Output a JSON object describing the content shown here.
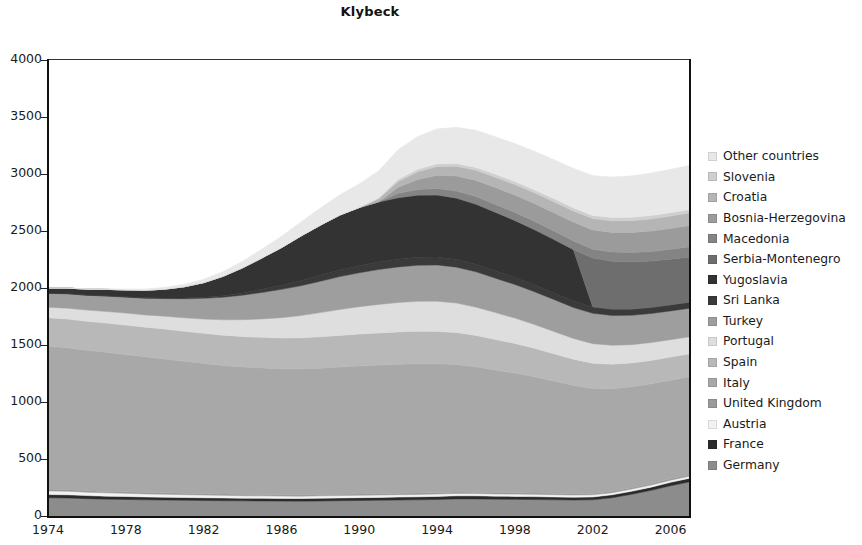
{
  "chart_data": {
    "type": "area",
    "title": "Klybeck",
    "xlabel": "",
    "ylabel": "",
    "stacked": true,
    "grid": false,
    "legend_position": "right",
    "xlim": [
      1974,
      2007
    ],
    "ylim": [
      0,
      4000
    ],
    "ytick_values": [
      0,
      500,
      1000,
      1500,
      2000,
      2500,
      3000,
      3500,
      4000
    ],
    "ytick_labels": [
      "0",
      "500",
      "1000",
      "1500",
      "2000",
      "2500",
      "3000",
      "3500",
      "4000"
    ],
    "xtick_values": [
      1974,
      1978,
      1982,
      1986,
      1990,
      1994,
      1998,
      2002,
      2006
    ],
    "xtick_labels": [
      "1974",
      "1978",
      "1982",
      "1986",
      "1990",
      "1994",
      "1998",
      "2002",
      "2006"
    ],
    "x": [
      1974,
      1975,
      1976,
      1977,
      1978,
      1979,
      1980,
      1981,
      1982,
      1983,
      1984,
      1985,
      1986,
      1987,
      1988,
      1989,
      1990,
      1991,
      1992,
      1993,
      1994,
      1995,
      1996,
      1997,
      1998,
      1999,
      2000,
      2001,
      2002,
      2003,
      2004,
      2005,
      2006,
      2007
    ],
    "stack_order_bottom_to_top": [
      "Germany",
      "France",
      "Austria",
      "United Kingdom",
      "Italy",
      "Spain",
      "Portugal",
      "Turkey",
      "Sri Lanka",
      "Yugoslavia",
      "Serbia-Montenegro",
      "Macedonia",
      "Bosnia-Herzegovina",
      "Croatia",
      "Slovenia",
      "Other countries"
    ],
    "series": [
      {
        "name": "Germany",
        "color": "#8c8c8c",
        "values": [
          160,
          158,
          152,
          148,
          145,
          142,
          140,
          138,
          136,
          134,
          133,
          132,
          131,
          130,
          132,
          134,
          136,
          138,
          140,
          142,
          145,
          150,
          150,
          148,
          146,
          144,
          142,
          140,
          142,
          160,
          190,
          225,
          265,
          300
        ]
      },
      {
        "name": "France",
        "color": "#2b2b2b",
        "values": [
          28,
          28,
          27,
          26,
          26,
          25,
          25,
          24,
          24,
          24,
          23,
          23,
          23,
          23,
          24,
          24,
          25,
          25,
          26,
          26,
          27,
          27,
          27,
          26,
          26,
          26,
          25,
          25,
          25,
          26,
          27,
          28,
          30,
          32
        ]
      },
      {
        "name": "Austria",
        "color": "#f2f2f2",
        "values": [
          32,
          31,
          30,
          29,
          28,
          27,
          26,
          25,
          24,
          23,
          22,
          22,
          21,
          21,
          21,
          21,
          21,
          21,
          21,
          21,
          21,
          21,
          20,
          20,
          20,
          20,
          20,
          19,
          19,
          19,
          19,
          19,
          19,
          19
        ]
      },
      {
        "name": "United Kingdom",
        "color": "#9a9a9a",
        "values": [
          14,
          14,
          13,
          13,
          13,
          12,
          12,
          12,
          12,
          12,
          12,
          12,
          12,
          12,
          12,
          12,
          12,
          12,
          12,
          12,
          12,
          12,
          12,
          12,
          12,
          12,
          12,
          12,
          12,
          12,
          12,
          12,
          12,
          12
        ]
      },
      {
        "name": "Italy",
        "color": "#a8a8a8",
        "values": [
          1255,
          1245,
          1232,
          1220,
          1205,
          1190,
          1175,
          1158,
          1142,
          1128,
          1118,
          1110,
          1105,
          1105,
          1108,
          1115,
          1122,
          1128,
          1132,
          1135,
          1130,
          1120,
          1100,
          1075,
          1050,
          1020,
          985,
          950,
          920,
          900,
          885,
          875,
          865,
          860
        ]
      },
      {
        "name": "Spain",
        "color": "#b8b8b8",
        "values": [
          250,
          252,
          254,
          256,
          258,
          260,
          262,
          263,
          264,
          265,
          266,
          268,
          270,
          272,
          275,
          278,
          280,
          282,
          284,
          285,
          284,
          280,
          275,
          268,
          260,
          250,
          240,
          230,
          222,
          215,
          210,
          206,
          203,
          200
        ]
      },
      {
        "name": "Portugal",
        "color": "#dedede",
        "values": [
          92,
          95,
          98,
          102,
          105,
          108,
          112,
          118,
          125,
          135,
          148,
          162,
          178,
          195,
          212,
          228,
          240,
          250,
          258,
          262,
          265,
          258,
          248,
          235,
          222,
          208,
          195,
          182,
          172,
          165,
          160,
          156,
          153,
          150
        ]
      },
      {
        "name": "Turkey",
        "color": "#9e9e9e",
        "values": [
          122,
          126,
          130,
          135,
          140,
          146,
          155,
          168,
          182,
          198,
          215,
          232,
          248,
          262,
          275,
          288,
          298,
          306,
          312,
          316,
          318,
          315,
          310,
          302,
          295,
          288,
          280,
          272,
          266,
          262,
          258,
          255,
          252,
          250
        ]
      },
      {
        "name": "Sri Lanka",
        "color": "#3a3a3a",
        "values": [
          2,
          2,
          2,
          3,
          3,
          4,
          5,
          7,
          10,
          14,
          20,
          28,
          36,
          44,
          52,
          58,
          62,
          66,
          68,
          70,
          70,
          68,
          66,
          64,
          62,
          60,
          58,
          56,
          55,
          54,
          53,
          52,
          52,
          52
        ]
      },
      {
        "name": "Yugoslavia",
        "color": "#333333",
        "values": [
          45,
          48,
          52,
          56,
          60,
          66,
          78,
          98,
          128,
          170,
          220,
          275,
          330,
          392,
          440,
          482,
          510,
          528,
          540,
          546,
          545,
          538,
          528,
          515,
          500,
          485,
          470,
          452,
          0,
          0,
          0,
          0,
          0,
          0
        ]
      },
      {
        "name": "Serbia-Montenegro",
        "color": "#6e6e6e",
        "values": [
          0,
          0,
          0,
          0,
          0,
          0,
          0,
          0,
          0,
          0,
          0,
          0,
          0,
          0,
          0,
          0,
          0,
          0,
          0,
          0,
          0,
          0,
          0,
          0,
          0,
          0,
          0,
          0,
          430,
          422,
          415,
          408,
          402,
          398
        ]
      },
      {
        "name": "Macedonia",
        "color": "#848484",
        "values": [
          0,
          0,
          0,
          0,
          0,
          0,
          0,
          0,
          0,
          0,
          0,
          0,
          0,
          0,
          0,
          0,
          0,
          0,
          38,
          48,
          56,
          62,
          66,
          68,
          70,
          72,
          74,
          76,
          78,
          80,
          82,
          84,
          86,
          88
        ]
      },
      {
        "name": "Bosnia-Herzegovina",
        "color": "#9b9b9b",
        "values": [
          0,
          0,
          0,
          0,
          0,
          0,
          0,
          0,
          0,
          0,
          0,
          0,
          0,
          0,
          0,
          0,
          0,
          0,
          52,
          88,
          115,
          132,
          142,
          148,
          152,
          156,
          160,
          164,
          168,
          172,
          176,
          180,
          184,
          188
        ]
      },
      {
        "name": "Croatia",
        "color": "#b5b5b5",
        "values": [
          0,
          0,
          0,
          0,
          0,
          0,
          0,
          0,
          0,
          0,
          0,
          0,
          0,
          0,
          0,
          0,
          0,
          26,
          52,
          68,
          78,
          84,
          88,
          90,
          92,
          94,
          96,
          98,
          100,
          102,
          104,
          106,
          108,
          110
        ]
      },
      {
        "name": "Slovenia",
        "color": "#cfcfcf",
        "values": [
          0,
          0,
          0,
          0,
          0,
          0,
          0,
          0,
          0,
          0,
          0,
          0,
          0,
          0,
          0,
          0,
          0,
          10,
          18,
          22,
          24,
          25,
          26,
          26,
          27,
          27,
          28,
          28,
          28,
          29,
          29,
          30,
          30,
          30
        ]
      },
      {
        "name": "Other countries",
        "color": "#e8e8e8",
        "values": [
          0,
          2,
          4,
          6,
          8,
          12,
          16,
          22,
          30,
          42,
          58,
          78,
          100,
          124,
          150,
          178,
          208,
          236,
          262,
          288,
          306,
          318,
          326,
          330,
          334,
          338,
          342,
          346,
          350,
          356,
          364,
          372,
          380,
          388
        ]
      }
    ],
    "legend_entries": [
      {
        "label": "Other countries",
        "color": "#e8e8e8"
      },
      {
        "label": "Slovenia",
        "color": "#cfcfcf"
      },
      {
        "label": "Croatia",
        "color": "#b5b5b5"
      },
      {
        "label": "Bosnia-Herzegovina",
        "color": "#9b9b9b"
      },
      {
        "label": "Macedonia",
        "color": "#848484"
      },
      {
        "label": "Serbia-Montenegro",
        "color": "#6e6e6e"
      },
      {
        "label": "Yugoslavia",
        "color": "#333333"
      },
      {
        "label": "Sri Lanka",
        "color": "#3a3a3a"
      },
      {
        "label": "Turkey",
        "color": "#9e9e9e"
      },
      {
        "label": "Portugal",
        "color": "#dedede"
      },
      {
        "label": "Spain",
        "color": "#b8b8b8"
      },
      {
        "label": "Italy",
        "color": "#a8a8a8"
      },
      {
        "label": "United Kingdom",
        "color": "#9a9a9a"
      },
      {
        "label": "Austria",
        "color": "#f2f2f2"
      },
      {
        "label": "France",
        "color": "#2b2b2b"
      },
      {
        "label": "Germany",
        "color": "#8c8c8c"
      }
    ]
  }
}
